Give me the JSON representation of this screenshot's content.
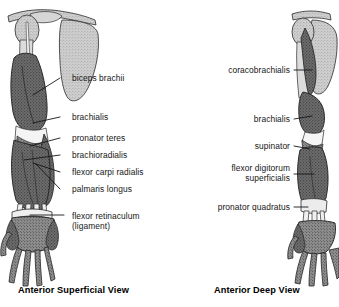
{
  "figure": {
    "title_present": false,
    "background": "#ffffff",
    "ink": "#161616"
  },
  "panels": [
    {
      "id": "anterior-superficial",
      "caption": "Anterior Superficial View",
      "caption_x": 18,
      "caption_y": 285,
      "labels": [
        {
          "key": "biceps-brachii",
          "text": "biceps brachii",
          "x": 72,
          "y": 73,
          "align": "left",
          "leader": {
            "x1": 60,
            "y1": 78,
            "x2": 33,
            "y2": 95
          }
        },
        {
          "key": "brachialis",
          "text": "brachialis",
          "x": 72,
          "y": 112,
          "align": "left",
          "leader": {
            "x1": 60,
            "y1": 117,
            "x2": 33,
            "y2": 123
          }
        },
        {
          "key": "pronator-teres",
          "text": "pronator teres",
          "x": 72,
          "y": 133,
          "align": "left",
          "leader": {
            "x1": 60,
            "y1": 138,
            "x2": 30,
            "y2": 146
          }
        },
        {
          "key": "brachioradialis",
          "text": "brachioradialis",
          "x": 72,
          "y": 150,
          "align": "left",
          "leader": {
            "x1": 60,
            "y1": 155,
            "x2": 24,
            "y2": 160
          }
        },
        {
          "key": "flexor-carpi-radialis",
          "text": "flexor carpi radialis",
          "x": 72,
          "y": 167,
          "align": "left",
          "leader": {
            "x1": 60,
            "y1": 172,
            "x2": 33,
            "y2": 163
          }
        },
        {
          "key": "palmaris-longus",
          "text": "palmaris longus",
          "x": 72,
          "y": 184,
          "align": "left",
          "leader": {
            "x1": 60,
            "y1": 189,
            "x2": 36,
            "y2": 164
          }
        },
        {
          "key": "flexor-retinaculum",
          "text": "flexor retinaculum\n(ligament)",
          "x": 72,
          "y": 211,
          "align": "left",
          "leader": {
            "x1": 64,
            "y1": 215,
            "x2": 30,
            "y2": 215
          }
        }
      ]
    },
    {
      "id": "anterior-deep",
      "caption": "Anterior Deep View",
      "caption_x": 214,
      "caption_y": 285,
      "labels": [
        {
          "key": "coracobrachialis",
          "text": "coracobrachialis",
          "x": 290,
          "y": 65,
          "align": "right",
          "leader": {
            "x1": 294,
            "y1": 70,
            "x2": 312,
            "y2": 70
          }
        },
        {
          "key": "brachialis-deep",
          "text": "brachialis",
          "x": 290,
          "y": 114,
          "align": "right",
          "leader": {
            "x1": 294,
            "y1": 119,
            "x2": 312,
            "y2": 116
          }
        },
        {
          "key": "supinator",
          "text": "supinator",
          "x": 290,
          "y": 141,
          "align": "right",
          "leader": {
            "x1": 294,
            "y1": 146,
            "x2": 310,
            "y2": 149
          }
        },
        {
          "key": "flexor-digitorum-superficialis",
          "text": "flexor digitorum\nsuperficialis",
          "x": 290,
          "y": 163,
          "align": "right",
          "leader": {
            "x1": 294,
            "y1": 174,
            "x2": 314,
            "y2": 174
          }
        },
        {
          "key": "pronator-quadratus",
          "text": "pronator quadratus",
          "x": 290,
          "y": 202,
          "align": "right",
          "leader": {
            "x1": 294,
            "y1": 207,
            "x2": 308,
            "y2": 207
          }
        }
      ]
    }
  ],
  "colors": {
    "muscle_dark": "#4a4a4a",
    "muscle_mid": "#7c7c7c",
    "bone_light": "#c9c9c9",
    "bone_pale": "#e2e2e2",
    "outline": "#2b2b2b",
    "leader": "#161616"
  }
}
